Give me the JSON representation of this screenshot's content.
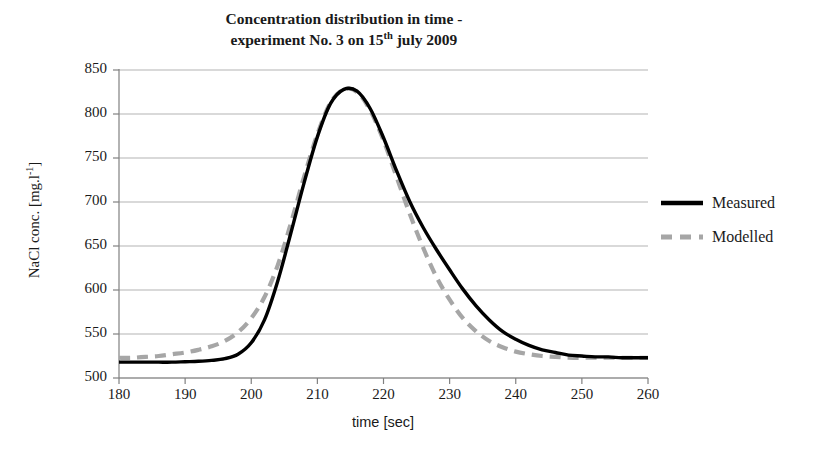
{
  "chart_data": {
    "type": "line",
    "title": "Concentration distribution in time - experiment No. 3 on 15th july 2009",
    "title_line1": "Concentration distribution in time -",
    "title_line2_pre": "experiment No. 3 on 15",
    "title_line2_sup": "th",
    "title_line2_post": " july 2009",
    "xlabel": "time [sec]",
    "ylabel": "NaCl conc. [mg.l-1]",
    "ylabel_pre": "NaCl conc. [mg.l",
    "ylabel_sup": "-1",
    "ylabel_post": "]",
    "xlim": [
      180,
      260
    ],
    "ylim": [
      500,
      850
    ],
    "xticks": [
      180,
      190,
      200,
      210,
      220,
      230,
      240,
      250,
      260
    ],
    "yticks": [
      500,
      550,
      600,
      650,
      700,
      750,
      800,
      850
    ],
    "grid": "horizontal",
    "legend_position": "right",
    "gridline_color": "#b3b3b3",
    "axis_color": "#808080",
    "x": [
      180,
      182,
      184,
      186,
      188,
      190,
      192,
      194,
      196,
      198,
      200,
      202,
      204,
      206,
      208,
      210,
      212,
      214,
      216,
      218,
      220,
      222,
      224,
      226,
      228,
      230,
      232,
      234,
      236,
      238,
      240,
      242,
      244,
      246,
      248,
      250,
      252,
      254,
      256,
      258,
      260
    ],
    "series": [
      {
        "name": "Measured",
        "color": "#000000",
        "style": "solid",
        "width": 3.4,
        "values": [
          518,
          518,
          518,
          518,
          518,
          518.5,
          519,
          520,
          522,
          527,
          540,
          566,
          610,
          665,
          722,
          774,
          812,
          828,
          826,
          806,
          773,
          735,
          700,
          671,
          646,
          623,
          601,
          582,
          566,
          553,
          544,
          537,
          532,
          529,
          526,
          525,
          524,
          524,
          523,
          523,
          523
        ]
      },
      {
        "name": "Modelled",
        "color": "#a6a6a6",
        "style": "dashed",
        "width": 4.2,
        "values": [
          523,
          523,
          524,
          525,
          527,
          529,
          532,
          536,
          542,
          552,
          568,
          592,
          628,
          676,
          729,
          777,
          813,
          828,
          825,
          804,
          770,
          728,
          686,
          648,
          615,
          589,
          568,
          553,
          542,
          535,
          530,
          527,
          525,
          524,
          523,
          523,
          523,
          523,
          523,
          523,
          523
        ]
      }
    ]
  }
}
